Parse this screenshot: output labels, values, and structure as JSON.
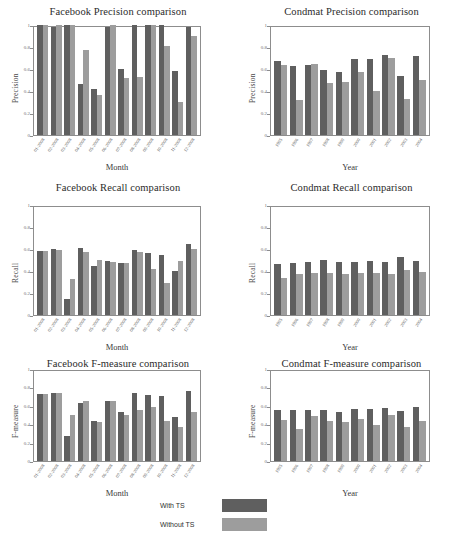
{
  "legend": {
    "items": [
      {
        "label": "With TS",
        "color": "#5f5f5f",
        "key": "ts"
      },
      {
        "label": "Without TS",
        "color": "#9d9d9d",
        "key": "nots"
      }
    ]
  },
  "axis": {
    "yticks": [
      "0",
      "0.2",
      "0.4",
      "0.6",
      "0.8",
      "1"
    ],
    "ylim": [
      0,
      1
    ]
  },
  "facebook_categories": [
    "01-2008",
    "02-2008",
    "03-2008",
    "04-2008",
    "05-2008",
    "06-2008",
    "07-2008",
    "08-2008",
    "09-2008",
    "10-2008",
    "11-2008",
    "12-2008"
  ],
  "condmat_categories": [
    "1995",
    "1996",
    "1997",
    "1998",
    "1999",
    "2000",
    "2001",
    "2002",
    "2003",
    "2004"
  ],
  "chart_data": [
    {
      "id": "facebook-precision",
      "type": "bar",
      "title": "Facebook Precision comparison",
      "xlabel": "Month",
      "ylabel": "Precision",
      "ylim": [
        0,
        1
      ],
      "grid": false,
      "legend_position": "bottom-external",
      "categories": [
        "01-2008",
        "02-2008",
        "03-2008",
        "04-2008",
        "05-2008",
        "06-2008",
        "07-2008",
        "08-2008",
        "09-2008",
        "10-2008",
        "11-2008",
        "12-2008"
      ],
      "series": [
        {
          "name": "With TS",
          "values": [
            1.0,
            0.98,
            1.0,
            0.46,
            0.42,
            0.98,
            0.6,
            1.0,
            1.0,
            1.0,
            0.58,
            0.98
          ]
        },
        {
          "name": "Without TS",
          "values": [
            1.0,
            1.0,
            1.0,
            0.77,
            0.36,
            1.0,
            0.52,
            0.53,
            1.0,
            0.81,
            0.3,
            0.9
          ]
        }
      ]
    },
    {
      "id": "condmat-precision",
      "type": "bar",
      "title": "Condmat Precision comparison",
      "xlabel": "Year",
      "ylabel": "Precision",
      "ylim": [
        0,
        1
      ],
      "grid": false,
      "legend_position": "bottom-external",
      "categories": [
        "1995",
        "1996",
        "1997",
        "1998",
        "1999",
        "2000",
        "2001",
        "2002",
        "2003",
        "2004"
      ],
      "series": [
        {
          "name": "With TS",
          "values": [
            0.67,
            0.63,
            0.64,
            0.59,
            0.57,
            0.69,
            0.69,
            0.73,
            0.54,
            0.72
          ]
        },
        {
          "name": "Without TS",
          "values": [
            0.64,
            0.32,
            0.65,
            0.47,
            0.48,
            0.57,
            0.4,
            0.7,
            0.33,
            0.5
          ]
        }
      ]
    },
    {
      "id": "facebook-recall",
      "type": "bar",
      "title": "Facebook Recall comparison",
      "xlabel": "Month",
      "ylabel": "Recall",
      "ylim": [
        0,
        1
      ],
      "grid": false,
      "legend_position": "bottom-external",
      "categories": [
        "01-2008",
        "02-2008",
        "03-2008",
        "04-2008",
        "05-2008",
        "06-2008",
        "07-2008",
        "08-2008",
        "09-2008",
        "10-2008",
        "11-2008",
        "12-2008"
      ],
      "series": [
        {
          "name": "With TS",
          "values": [
            0.58,
            0.6,
            0.15,
            0.61,
            0.45,
            0.49,
            0.47,
            0.59,
            0.56,
            0.55,
            0.4,
            0.65
          ]
        },
        {
          "name": "Without TS",
          "values": [
            0.58,
            0.59,
            0.33,
            0.57,
            0.5,
            0.48,
            0.47,
            0.57,
            0.42,
            0.29,
            0.49,
            0.6
          ]
        }
      ]
    },
    {
      "id": "condmat-recall",
      "type": "bar",
      "title": "Condmat Recall comparison",
      "xlabel": "Year",
      "ylabel": "Recall",
      "ylim": [
        0,
        1
      ],
      "grid": false,
      "legend_position": "bottom-external",
      "categories": [
        "1995",
        "1996",
        "1997",
        "1998",
        "1999",
        "2000",
        "2001",
        "2002",
        "2003",
        "2004"
      ],
      "series": [
        {
          "name": "With TS",
          "values": [
            0.46,
            0.47,
            0.48,
            0.5,
            0.48,
            0.48,
            0.49,
            0.48,
            0.53,
            0.49
          ]
        },
        {
          "name": "Without TS",
          "values": [
            0.34,
            0.37,
            0.38,
            0.38,
            0.37,
            0.38,
            0.38,
            0.37,
            0.41,
            0.39
          ]
        }
      ]
    },
    {
      "id": "facebook-fmeasure",
      "type": "bar",
      "title": "Facebook F-measure comparison",
      "xlabel": "Month",
      "ylabel": "F-measure",
      "ylim": [
        0,
        1
      ],
      "grid": false,
      "legend_position": "bottom-external",
      "categories": [
        "01-2008",
        "02-2008",
        "03-2008",
        "04-2008",
        "05-2008",
        "06-2008",
        "07-2008",
        "08-2008",
        "09-2008",
        "10-2008",
        "11-2008",
        "12-2008"
      ],
      "series": [
        {
          "name": "With TS",
          "values": [
            0.73,
            0.74,
            0.27,
            0.63,
            0.44,
            0.65,
            0.53,
            0.74,
            0.72,
            0.71,
            0.48,
            0.76
          ]
        },
        {
          "name": "Without TS",
          "values": [
            0.73,
            0.74,
            0.5,
            0.65,
            0.42,
            0.65,
            0.5,
            0.55,
            0.59,
            0.43,
            0.37,
            0.53
          ]
        }
      ]
    },
    {
      "id": "condmat-fmeasure",
      "type": "bar",
      "title": "Condmat F-measure comparison",
      "xlabel": "Year",
      "ylabel": "F-measure",
      "ylim": [
        0,
        1
      ],
      "grid": false,
      "legend_position": "bottom-external",
      "categories": [
        "1995",
        "1996",
        "1997",
        "1998",
        "1999",
        "2000",
        "2001",
        "2002",
        "2003",
        "2004"
      ],
      "series": [
        {
          "name": "With TS",
          "values": [
            0.55,
            0.55,
            0.55,
            0.55,
            0.53,
            0.57,
            0.57,
            0.58,
            0.54,
            0.59
          ]
        },
        {
          "name": "Without TS",
          "values": [
            0.45,
            0.35,
            0.49,
            0.43,
            0.42,
            0.46,
            0.39,
            0.5,
            0.37,
            0.44
          ]
        }
      ]
    }
  ]
}
